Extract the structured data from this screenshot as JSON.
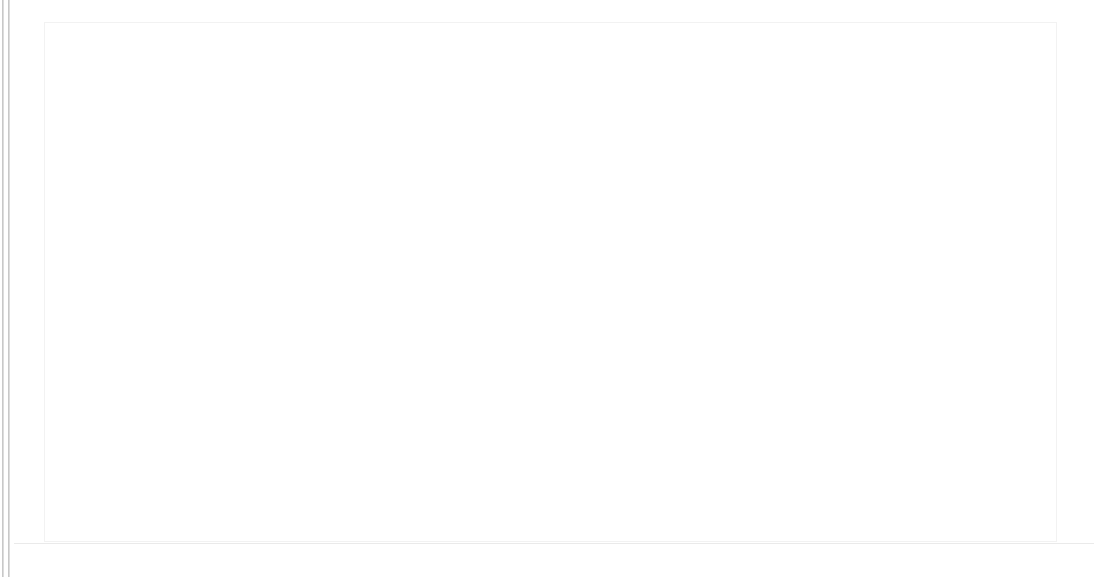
{
  "page": {
    "background": "#ffffff",
    "width": 1094,
    "height": 577
  },
  "left_gutter": {
    "name": "vertical-scrollbar",
    "rule_color": "#c8c8c8",
    "thumb_color": "#0d0d0d",
    "thumb_top": 105,
    "thumb_height": 240
  },
  "card": {
    "name": "map-card",
    "background": "#ffffff",
    "border_color": "#f2f2f2",
    "x": 44,
    "y": 22,
    "width": 1013,
    "height": 520
  },
  "bottom_rule": {
    "color": "#eaeaea"
  },
  "chart_data": {
    "type": "map",
    "subtype": "choropleth",
    "title": "",
    "subtitle": "",
    "xlabel": "",
    "ylabel": "",
    "projection": "equirectangular",
    "grid": false,
    "legend": null,
    "legend_position": "none",
    "ocean_color": "#ffffff",
    "border_color": "#ffffff",
    "no_data_color": "#fcfcfc",
    "scale_type": "sequential-grey",
    "color_scale": [
      {
        "level": 0,
        "color": "#fbfbfb",
        "label": "lowest"
      },
      {
        "level": 1,
        "color": "#f4f4f4",
        "label": "very low"
      },
      {
        "level": 2,
        "color": "#ededed",
        "label": "low"
      },
      {
        "level": 3,
        "color": "#e2e2e2",
        "label": "below average"
      },
      {
        "level": 4,
        "color": "#d6d6d6",
        "label": "average"
      },
      {
        "level": 5,
        "color": "#c6c6c6",
        "label": "above average"
      },
      {
        "level": 6,
        "color": "#b0b0b0",
        "label": "high"
      },
      {
        "level": 7,
        "color": "#9a9a9a",
        "label": "very high"
      },
      {
        "level": 8,
        "color": "#7e7e7e",
        "label": "highest"
      },
      {
        "level": 9,
        "color": "#3a3a3a",
        "label": "maximum"
      }
    ],
    "regions": [
      {
        "name": "Canada",
        "level": 2,
        "color": "#ededed"
      },
      {
        "name": "Greenland",
        "level": 1,
        "color": "#f6f6f6"
      },
      {
        "name": "United States",
        "level": 5,
        "color": "#c6c6c6"
      },
      {
        "name": "Alaska",
        "level": 5,
        "color": "#c6c6c6"
      },
      {
        "name": "Mexico",
        "level": 1,
        "color": "#f7f7f7"
      },
      {
        "name": "Cuba",
        "level": 1,
        "color": "#f7f7f7"
      },
      {
        "name": "Central America",
        "level": 1,
        "color": "#f7f7f7"
      },
      {
        "name": "Colombia",
        "level": 1,
        "color": "#f7f7f7"
      },
      {
        "name": "Venezuela",
        "level": 1,
        "color": "#f7f7f7"
      },
      {
        "name": "Guyana/Suriname",
        "level": 9,
        "color": "#4a4a4a"
      },
      {
        "name": "Brazil",
        "level": 1,
        "color": "#f8f8f8"
      },
      {
        "name": "Peru",
        "level": 1,
        "color": "#f8f8f8"
      },
      {
        "name": "Bolivia",
        "level": 1,
        "color": "#f8f8f8"
      },
      {
        "name": "Chile",
        "level": 1,
        "color": "#f8f8f8"
      },
      {
        "name": "Argentina",
        "level": 1,
        "color": "#f8f8f8"
      },
      {
        "name": "Iceland",
        "level": 3,
        "color": "#e2e2e2"
      },
      {
        "name": "Norway",
        "level": 4,
        "color": "#d9d9d9"
      },
      {
        "name": "Sweden",
        "level": 4,
        "color": "#d9d9d9"
      },
      {
        "name": "Finland",
        "level": 4,
        "color": "#d6d6d6"
      },
      {
        "name": "United Kingdom",
        "level": 4,
        "color": "#d6d6d6"
      },
      {
        "name": "Ireland",
        "level": 3,
        "color": "#e2e2e2"
      },
      {
        "name": "Netherlands",
        "level": 9,
        "color": "#303030"
      },
      {
        "name": "Belgium",
        "level": 6,
        "color": "#b0b0b0"
      },
      {
        "name": "France",
        "level": 4,
        "color": "#d6d6d6"
      },
      {
        "name": "Spain",
        "level": 8,
        "color": "#7b7b7b"
      },
      {
        "name": "Portugal",
        "level": 8,
        "color": "#7b7b7b"
      },
      {
        "name": "Germany",
        "level": 5,
        "color": "#c6c6c6"
      },
      {
        "name": "Poland",
        "level": 4,
        "color": "#d6d6d6"
      },
      {
        "name": "Czechia",
        "level": 8,
        "color": "#6e6e6e"
      },
      {
        "name": "Austria",
        "level": 9,
        "color": "#5a5a5a"
      },
      {
        "name": "Hungary",
        "level": 9,
        "color": "#4e4e4e"
      },
      {
        "name": "Slovakia",
        "level": 9,
        "color": "#4e4e4e"
      },
      {
        "name": "Romania",
        "level": 8,
        "color": "#6e6e6e"
      },
      {
        "name": "Italy",
        "level": 2,
        "color": "#efefef"
      },
      {
        "name": "Switzerland",
        "level": 7,
        "color": "#8f8f8f"
      },
      {
        "name": "Balkans",
        "level": 3,
        "color": "#e6e6e6"
      },
      {
        "name": "Greece",
        "level": 2,
        "color": "#f0f0f0"
      },
      {
        "name": "Ukraine",
        "level": 4,
        "color": "#d6d6d6"
      },
      {
        "name": "Belarus",
        "level": 4,
        "color": "#d6d6d6"
      },
      {
        "name": "Baltics",
        "level": 4,
        "color": "#d6d6d6"
      },
      {
        "name": "Russia",
        "level": 4,
        "color": "#d4d4d4"
      },
      {
        "name": "Turkey",
        "level": 5,
        "color": "#c6c6c6"
      },
      {
        "name": "Kazakhstan",
        "level": 3,
        "color": "#e2e2e2"
      },
      {
        "name": "Mongolia",
        "level": 6,
        "color": "#b4b4b4"
      },
      {
        "name": "China",
        "level": 7,
        "color": "#9a9a9a"
      },
      {
        "name": "Japan",
        "level": 9,
        "color": "#363636"
      },
      {
        "name": "South Korea",
        "level": 9,
        "color": "#363636"
      },
      {
        "name": "North Korea",
        "level": 7,
        "color": "#909090"
      },
      {
        "name": "India",
        "level": 1,
        "color": "#f4f4f4"
      },
      {
        "name": "Pakistan",
        "level": 2,
        "color": "#efefef"
      },
      {
        "name": "Iran",
        "level": 2,
        "color": "#efefef"
      },
      {
        "name": "Saudi Arabia",
        "level": 1,
        "color": "#f7f7f7"
      },
      {
        "name": "Iraq",
        "level": 2,
        "color": "#f0f0f0"
      },
      {
        "name": "Myanmar",
        "level": 2,
        "color": "#f0f0f0"
      },
      {
        "name": "Thailand",
        "level": 2,
        "color": "#f0f0f0"
      },
      {
        "name": "Vietnam",
        "level": 3,
        "color": "#e6e6e6"
      },
      {
        "name": "Malaysia",
        "level": 8,
        "color": "#5e5e5e"
      },
      {
        "name": "Indonesia",
        "level": 9,
        "color": "#2e2e2e"
      },
      {
        "name": "Philippines",
        "level": 2,
        "color": "#efefef"
      },
      {
        "name": "Papua New Guinea",
        "level": 4,
        "color": "#dadada"
      },
      {
        "name": "Australia",
        "level": 1,
        "color": "#f6f6f6"
      },
      {
        "name": "New Zealand",
        "level": 1,
        "color": "#fafafa"
      },
      {
        "name": "Morocco",
        "level": 5,
        "color": "#c6c6c6"
      },
      {
        "name": "Algeria",
        "level": 4,
        "color": "#d6d6d6"
      },
      {
        "name": "Libya",
        "level": 5,
        "color": "#c0c0c0"
      },
      {
        "name": "Egypt",
        "level": 4,
        "color": "#d6d6d6"
      },
      {
        "name": "Sudan",
        "level": 3,
        "color": "#e6e6e6"
      },
      {
        "name": "Nigeria",
        "level": 2,
        "color": "#ededed"
      },
      {
        "name": "Ethiopia",
        "level": 2,
        "color": "#ededed"
      },
      {
        "name": "Kenya",
        "level": 3,
        "color": "#e2e2e2"
      },
      {
        "name": "DR Congo",
        "level": 7,
        "color": "#9e9e9e"
      },
      {
        "name": "Angola",
        "level": 7,
        "color": "#9e9e9e"
      },
      {
        "name": "Mozambique",
        "level": 7,
        "color": "#9e9e9e"
      },
      {
        "name": "Tanzania",
        "level": 2,
        "color": "#efefef"
      },
      {
        "name": "South Africa",
        "level": 2,
        "color": "#efefef"
      },
      {
        "name": "Madagascar",
        "level": 2,
        "color": "#f0f0f0"
      },
      {
        "name": "West Africa",
        "level": 2,
        "color": "#ededed"
      }
    ]
  }
}
